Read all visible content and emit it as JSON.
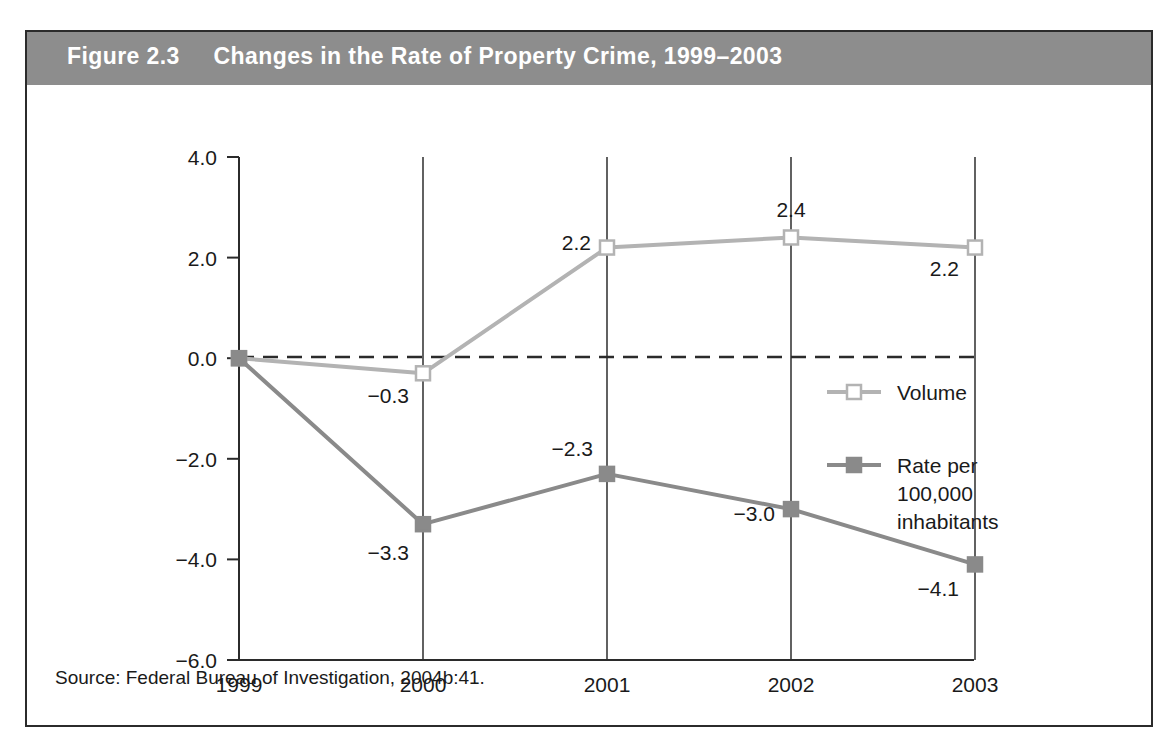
{
  "figure": {
    "number_label": "Figure 2.3",
    "title": "Changes in the Rate of Property Crime, 1999–2003",
    "title_full": "Figure 2.3     Changes in the Rate of Property Crime, 1999–2003",
    "source": "Source: Federal Bureau of Investigation, 2004b:41.",
    "header_color": "#8d8d8d",
    "border_color": "#2b2b2b",
    "background_color": "#ffffff"
  },
  "chart_data": {
    "type": "line",
    "title": "Changes in the Rate of Property Crime, 1999–2003",
    "xlabel": "",
    "ylabel": "",
    "categories": [
      "1999",
      "2000",
      "2001",
      "2002",
      "2003"
    ],
    "x": [
      1999,
      2000,
      2001,
      2002,
      2003
    ],
    "ylim": [
      -6.0,
      4.0
    ],
    "yticks": [
      4.0,
      2.0,
      0.0,
      -2.0,
      -4.0,
      -6.0
    ],
    "ytick_labels": [
      "4.0",
      "2.0",
      "0.0",
      "−2.0",
      "−4.0",
      "−6.0"
    ],
    "xtick_labels": [
      "1999",
      "2000",
      "2001",
      "2002",
      "2003"
    ],
    "grid": "vertical gridlines at each year; dashed horizontal reference line at 0.0",
    "zero_line": 0.0,
    "legend_position": "inside right, middle",
    "series": [
      {
        "name": "Volume",
        "color": "#b3b3b3",
        "marker": "open-square",
        "values": [
          0.0,
          -0.3,
          2.2,
          2.4,
          2.2
        ],
        "point_labels": [
          "",
          "−0.3",
          "2.2",
          "2.4",
          "2.2"
        ]
      },
      {
        "name": "Rate per 100,000 inhabitants",
        "color": "#8a8a8a",
        "marker": "filled-square",
        "values": [
          0.0,
          -3.3,
          -2.3,
          -3.0,
          -4.1
        ],
        "point_labels": [
          "",
          "−3.3",
          "−2.3",
          "−3.0",
          "−4.1"
        ]
      }
    ]
  },
  "legend": {
    "items": [
      {
        "label": "Volume",
        "label_lines": [
          "Volume"
        ]
      },
      {
        "label": "Rate per 100,000 inhabitants",
        "label_lines": [
          "Rate per",
          "100,000",
          "inhabitants"
        ]
      }
    ]
  }
}
